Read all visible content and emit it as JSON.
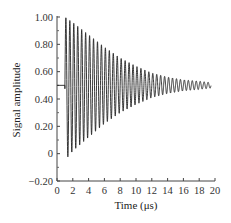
{
  "chart_data": {
    "type": "line",
    "title": "",
    "xlabel": "Time (μs)",
    "ylabel": "Signal amplitude",
    "xlim": [
      0,
      20
    ],
    "ylim": [
      -0.2,
      1.0
    ],
    "x_ticks": [
      "0",
      "2",
      "4",
      "6",
      "8",
      "10",
      "12",
      "14",
      "16",
      "18",
      "20"
    ],
    "y_ticks": [
      "−0.20",
      "0",
      "0.20",
      "0.40",
      "0.60",
      "0.80",
      "1.00"
    ],
    "grid": false,
    "legend": null,
    "series": [
      {
        "name": "damped oscillation",
        "description": "Flat baseline at 0.50 from t=0 to ~1 μs, then a rapidly oscillating decaying sinusoid centered at ~0.50; first peak ~1.0, first trough ~-0.05, amplitude decays to ~±0.02 by 19.5 μs",
        "baseline": 0.5,
        "start_time": 1.0,
        "end_time": 19.5,
        "initial_amplitude": 0.52,
        "final_amplitude": 0.02,
        "period_us": 0.5,
        "envelope_points": {
          "x": [
            1,
            2,
            4,
            6,
            8,
            10,
            12,
            14,
            16,
            18,
            19.5
          ],
          "upper": [
            1.0,
            0.96,
            0.87,
            0.78,
            0.7,
            0.64,
            0.59,
            0.56,
            0.54,
            0.53,
            0.52
          ],
          "lower": [
            -0.05,
            0.02,
            0.12,
            0.22,
            0.3,
            0.36,
            0.41,
            0.44,
            0.46,
            0.47,
            0.48
          ]
        }
      }
    ]
  }
}
